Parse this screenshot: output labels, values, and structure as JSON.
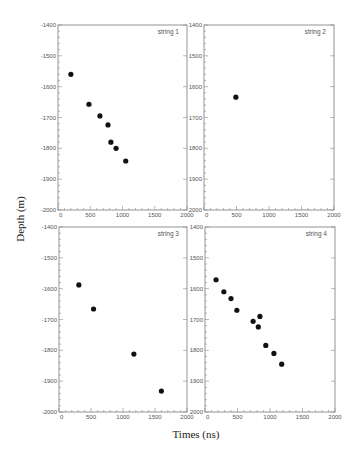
{
  "figure": {
    "xlabel": "Times (ns)",
    "ylabel": "Depth (m)"
  },
  "chart_data": [
    {
      "type": "scatter",
      "title": "string 1",
      "xlabel": "Times (ns)",
      "ylabel": "Depth (m)",
      "xlim": [
        0,
        2000
      ],
      "ylim": [
        -2000,
        -1400
      ],
      "xticks": [
        0,
        500,
        1000,
        1500,
        2000
      ],
      "yticks": [
        -2000,
        -1900,
        -1800,
        -1700,
        -1600,
        -1500,
        -1400
      ],
      "grid": false,
      "x": [
        200,
        480,
        650,
        775,
        820,
        900,
        1050
      ],
      "y": [
        -1560,
        -1657,
        -1695,
        -1724,
        -1780,
        -1800,
        -1841
      ]
    },
    {
      "type": "scatter",
      "title": "string 2",
      "xlabel": "Times (ns)",
      "ylabel": "Depth (m)",
      "xlim": [
        0,
        2000
      ],
      "ylim": [
        -2000,
        -1400
      ],
      "xticks": [
        0,
        500,
        1000,
        1500,
        2000
      ],
      "yticks": [
        -2000,
        -1900,
        -1800,
        -1700,
        -1600,
        -1500,
        -1400
      ],
      "grid": false,
      "x": [
        490
      ],
      "y": [
        -1634
      ]
    },
    {
      "type": "scatter",
      "title": "string 3",
      "xlabel": "Times (ns)",
      "ylabel": "Depth (m)",
      "xlim": [
        0,
        2000
      ],
      "ylim": [
        -2000,
        -1400
      ],
      "xticks": [
        0,
        500,
        1000,
        1500,
        2000
      ],
      "yticks": [
        -2000,
        -1900,
        -1800,
        -1700,
        -1600,
        -1500,
        -1400
      ],
      "grid": false,
      "x": [
        310,
        540,
        1170,
        1600
      ],
      "y": [
        -1588,
        -1666,
        -1812,
        -1932
      ]
    },
    {
      "type": "scatter",
      "title": "string 4",
      "xlabel": "Times (ns)",
      "ylabel": "Depth (m)",
      "xlim": [
        0,
        2000
      ],
      "ylim": [
        -2000,
        -1400
      ],
      "xticks": [
        0,
        500,
        1000,
        1500,
        2000
      ],
      "yticks": [
        -2000,
        -1900,
        -1800,
        -1700,
        -1600,
        -1500,
        -1400
      ],
      "grid": false,
      "x": [
        170,
        290,
        400,
        490,
        740,
        845,
        820,
        935,
        1060,
        1180
      ],
      "y": [
        -1571,
        -1610,
        -1632,
        -1670,
        -1706,
        -1690,
        -1724,
        -1784,
        -1810,
        -1845
      ]
    }
  ],
  "panels": [
    {
      "title": "string 1",
      "left": 58,
      "top": 25,
      "right": 187,
      "bottom": 210,
      "yticklabels": [
        "-1400",
        "-1500",
        "-1600",
        "-1700",
        "-1800",
        "-1900",
        "-2000"
      ]
    },
    {
      "title": "string 2",
      "left": 204,
      "top": 25,
      "right": 334,
      "bottom": 210,
      "yticklabels": [
        "1400",
        "1500",
        "1600",
        "1700",
        "1800",
        "1900",
        "2000"
      ]
    },
    {
      "title": "string 3",
      "left": 59,
      "top": 227,
      "right": 187,
      "bottom": 412,
      "yticklabels": [
        "-1400",
        "-1500",
        "-1600",
        "-1700",
        "-1800",
        "-1900",
        "-2000"
      ]
    },
    {
      "title": "string 4",
      "left": 205,
      "top": 227,
      "right": 335,
      "bottom": 412,
      "yticklabels": [
        "1400",
        "1500",
        "1600",
        "1700",
        "1800",
        "1900",
        "2000"
      ]
    }
  ],
  "xticklabels": [
    "0",
    "500",
    "1000",
    "1500",
    "2000"
  ]
}
